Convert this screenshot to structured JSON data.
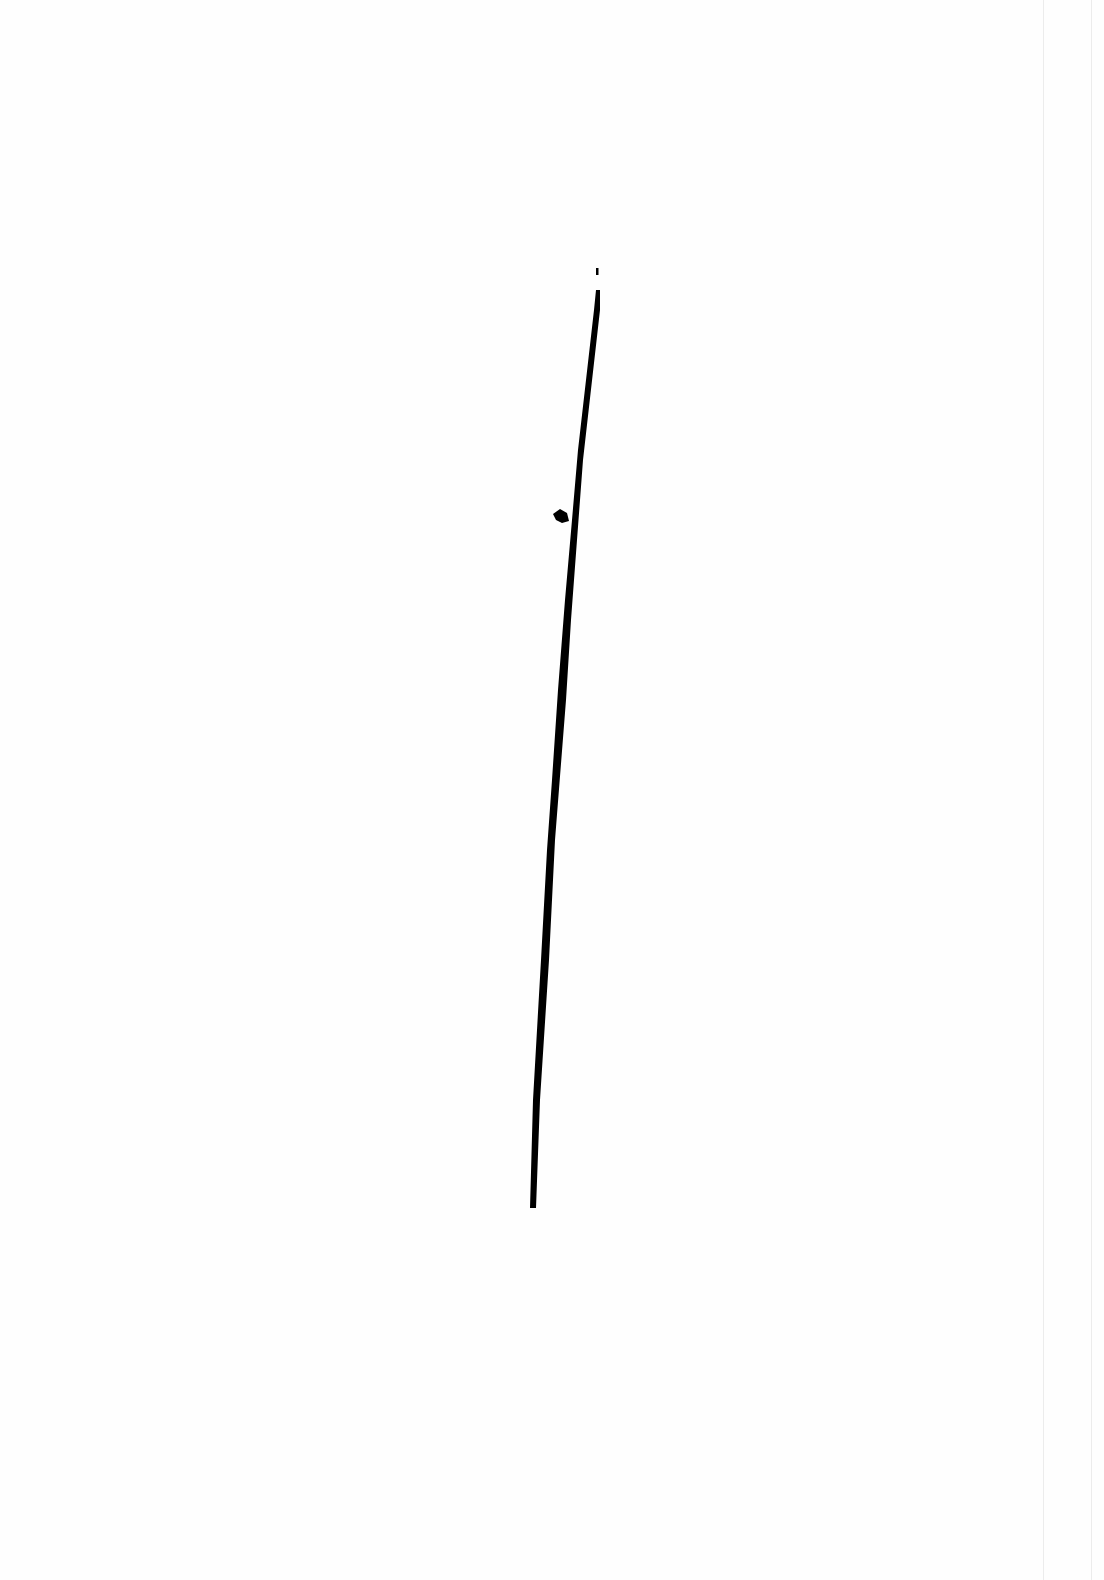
{
  "page": {
    "background": "#fefefe",
    "ink_color": "#000000",
    "edge_color": "#ececec"
  },
  "drawing": {
    "stroke": {
      "start": [
        598,
        288
      ],
      "end": [
        533,
        1210
      ],
      "width_top": 4,
      "width_bottom": 7
    },
    "tick": {
      "x": 597,
      "y": 271
    },
    "blob": {
      "x": 558,
      "y": 518
    }
  }
}
